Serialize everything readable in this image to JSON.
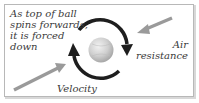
{
  "diagram": {
    "caption_lines": [
      "As top of ball",
      "spins forwards,",
      "it is forced",
      "down"
    ],
    "velocity_label": "Velocity",
    "air_resistance_lines": [
      "Air",
      "resistance"
    ],
    "colors": {
      "frame": "#b8b8b8",
      "text": "#3a3a3a",
      "spin_arrows": "#1e1e1e",
      "force_arrows": "#9a9a9a",
      "ball": "#cfcfcf"
    },
    "elements": {
      "ball": "spinning-ball",
      "spin_arrows": [
        "clockwise-arc-arrow-top-right",
        "clockwise-arc-arrow-bottom-left"
      ],
      "velocity_arrow": "arrow-up-right",
      "air_resistance_arrow": "arrow-down-left"
    }
  }
}
